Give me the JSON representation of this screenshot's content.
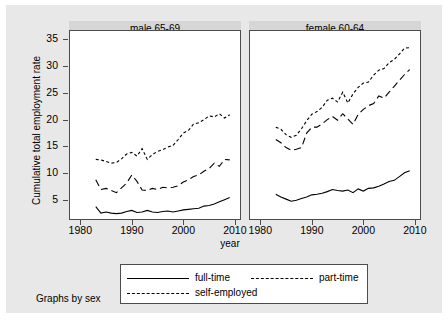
{
  "figure": {
    "note": "Graphs by sex",
    "xtitle": "year",
    "ytitle": "Cumulative total employment rate"
  },
  "legend": {
    "entries": [
      {
        "label": "full-time",
        "style": "solid"
      },
      {
        "label": "part-time",
        "style": "long-dash"
      },
      {
        "label": "self-employed",
        "style": "short-dash"
      }
    ]
  },
  "chart_data": {
    "type": "line",
    "title": "",
    "xlabel": "year",
    "ylabel": "Cumulative total employment rate",
    "xlim": [
      1978,
      2011
    ],
    "ylim": [
      1.5,
      36.5
    ],
    "xticks": [
      1980,
      1990,
      2000,
      2010
    ],
    "yticks": [
      5,
      10,
      15,
      20,
      25,
      30,
      35
    ],
    "grid": false,
    "legend_position": "bottom",
    "panels": [
      {
        "title": "male 65-69",
        "x": [
          1983,
          1984,
          1985,
          1986,
          1987,
          1988,
          1989,
          1990,
          1991,
          1992,
          1993,
          1994,
          1995,
          1996,
          1997,
          1998,
          1999,
          2000,
          2001,
          2002,
          2003,
          2004,
          2005,
          2006,
          2007,
          2008,
          2009
        ],
        "series": [
          {
            "name": "full-time",
            "style": "solid",
            "values": [
              3.8,
              2.6,
              2.8,
              2.6,
              2.5,
              2.6,
              2.9,
              3.1,
              2.7,
              2.8,
              3.1,
              2.8,
              2.7,
              2.9,
              3.0,
              2.8,
              3.0,
              3.2,
              3.3,
              3.4,
              3.5,
              3.9,
              4.0,
              4.3,
              4.7,
              5.1,
              5.5
            ]
          },
          {
            "name": "part-time",
            "style": "long-dash",
            "values": [
              8.8,
              7.0,
              7.2,
              6.8,
              6.4,
              7.3,
              8.2,
              9.7,
              8.5,
              6.9,
              6.8,
              7.2,
              7.0,
              7.4,
              7.3,
              7.4,
              7.7,
              8.4,
              8.8,
              9.4,
              9.7,
              10.4,
              10.9,
              11.9,
              11.3,
              12.6,
              12.5
            ]
          },
          {
            "name": "self-employed",
            "style": "short-dash",
            "values": [
              12.6,
              12.5,
              12.2,
              11.9,
              12.0,
              12.7,
              13.6,
              13.9,
              13.2,
              14.6,
              12.6,
              13.5,
              14.1,
              14.4,
              14.9,
              15.2,
              16.3,
              17.5,
              18.0,
              19.2,
              19.4,
              20.0,
              20.7,
              20.5,
              21.1,
              20.3,
              20.9
            ]
          }
        ]
      },
      {
        "title": "female 60-64",
        "x": [
          1983,
          1984,
          1985,
          1986,
          1987,
          1988,
          1989,
          1990,
          1991,
          1992,
          1993,
          1994,
          1995,
          1996,
          1997,
          1998,
          1999,
          2000,
          2001,
          2002,
          2003,
          2004,
          2005,
          2006,
          2007,
          2008,
          2009
        ],
        "series": [
          {
            "name": "full-time",
            "style": "solid",
            "values": [
              6.1,
              5.6,
              5.2,
              4.8,
              5.0,
              5.3,
              5.6,
              6.0,
              6.1,
              6.3,
              6.6,
              7.0,
              6.8,
              6.7,
              6.9,
              6.4,
              7.1,
              6.7,
              7.2,
              7.3,
              7.6,
              8.0,
              8.5,
              8.7,
              9.4,
              10.1,
              10.5
            ]
          },
          {
            "name": "part-time",
            "style": "long-dash",
            "values": [
              16.3,
              15.7,
              14.8,
              14.3,
              14.5,
              14.8,
              17.5,
              18.6,
              18.6,
              19.2,
              20.0,
              20.6,
              19.9,
              21.1,
              20.1,
              19.1,
              21.0,
              21.9,
              22.6,
              23.0,
              24.4,
              24.0,
              25.1,
              26.2,
              27.3,
              28.4,
              29.3
            ]
          },
          {
            "name": "self-employed",
            "style": "short-dash",
            "values": [
              18.6,
              18.2,
              17.2,
              16.7,
              17.1,
              18.3,
              19.8,
              21.0,
              21.5,
              22.3,
              23.6,
              24.0,
              23.3,
              25.1,
              23.1,
              24.8,
              26.0,
              26.8,
              27.0,
              28.3,
              29.2,
              29.5,
              30.6,
              31.2,
              32.2,
              33.3,
              33.4
            ]
          }
        ]
      }
    ]
  }
}
